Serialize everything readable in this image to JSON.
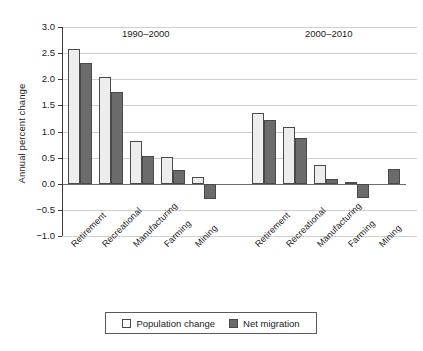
{
  "chart_data": {
    "type": "bar",
    "title": "",
    "xlabel": "",
    "ylabel": "Annual percent change",
    "ylim": [
      -1.0,
      3.0
    ],
    "ytick_step": 0.5,
    "grid": true,
    "legend_position": "bottom",
    "yticks": [
      "3.0",
      "2.5",
      "2.0",
      "1.5",
      "1.0",
      "0.5",
      "0.0",
      "-0.5",
      "-1.0"
    ],
    "ytick_values": [
      3.0,
      2.5,
      2.0,
      1.5,
      1.0,
      0.5,
      0.0,
      -0.5,
      -1.0
    ],
    "categories": [
      "Retirement",
      "Recreational",
      "Manufacturing",
      "Farming",
      "Mining"
    ],
    "panels": [
      {
        "label": "1990–2000",
        "categories": [
          "Retirement",
          "Recreational",
          "Manufacturing",
          "Farming",
          "Mining"
        ],
        "series": [
          {
            "name": "Population change",
            "values": [
              2.58,
              2.05,
              0.81,
              0.52,
              0.12
            ]
          },
          {
            "name": "Net migration",
            "values": [
              2.32,
              1.76,
              0.53,
              0.27,
              -0.3
            ]
          }
        ]
      },
      {
        "label": "2000–2010",
        "categories": [
          "Retirement",
          "Recreational",
          "Manufacturing",
          "Farming",
          "Mining"
        ],
        "series": [
          {
            "name": "Population change",
            "values": [
              1.35,
              1.08,
              0.35,
              0.04,
              0.0
            ]
          },
          {
            "name": "Net migration",
            "values": [
              1.22,
              0.88,
              0.1,
              -0.28,
              0.29
            ]
          }
        ]
      }
    ],
    "legend": [
      {
        "label": "Population change",
        "swatch": "light",
        "color": "#ffffff"
      },
      {
        "label": "Net migration",
        "swatch": "dark",
        "color": "#6b6b6b"
      }
    ],
    "colors": {
      "population_change": "#ededed",
      "net_migration": "#6b6b6b",
      "bar_border": "#4a4a4a",
      "gridline": "#cfcfcf",
      "axis": "#3c3c3c",
      "zero_line": "#6d6d6d",
      "background": "#ffffff",
      "text": "#1a1a1a"
    }
  }
}
